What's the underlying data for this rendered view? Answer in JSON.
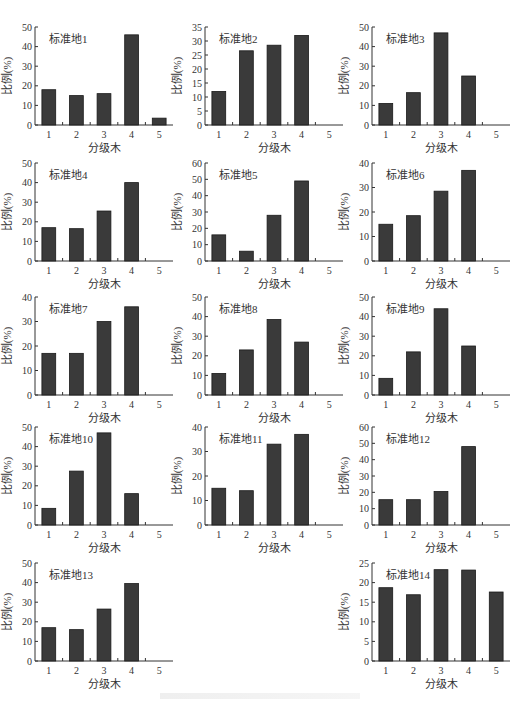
{
  "chart_data": [
    {
      "type": "bar",
      "title": "标准地1",
      "categories": [
        "1",
        "2",
        "3",
        "4",
        "5"
      ],
      "values": [
        18,
        15,
        16,
        46,
        3.5
      ],
      "xlabel": "分级木",
      "ylabel": "比例(%)",
      "ylim": [
        0,
        50
      ],
      "yticks": [
        0,
        10,
        20,
        30,
        40,
        50
      ],
      "grid": false,
      "legend": null
    },
    {
      "type": "bar",
      "title": "标准地2",
      "categories": [
        "1",
        "2",
        "3",
        "4",
        "5"
      ],
      "values": [
        12,
        26.5,
        28.5,
        32,
        0
      ],
      "xlabel": "分级木",
      "ylabel": "比例(%)",
      "ylim": [
        0,
        35
      ],
      "yticks": [
        0,
        5,
        10,
        15,
        20,
        25,
        30,
        35
      ],
      "grid": false,
      "legend": null
    },
    {
      "type": "bar",
      "title": "标准地3",
      "categories": [
        "1",
        "2",
        "3",
        "4",
        "5"
      ],
      "values": [
        11,
        16.5,
        47,
        25,
        0
      ],
      "xlabel": "分级木",
      "ylabel": "比例(%)",
      "ylim": [
        0,
        50
      ],
      "yticks": [
        0,
        10,
        20,
        30,
        40,
        50
      ],
      "grid": false,
      "legend": null
    },
    {
      "type": "bar",
      "title": "标准地4",
      "categories": [
        "1",
        "2",
        "3",
        "4",
        "5"
      ],
      "values": [
        17,
        16.5,
        25.5,
        40,
        0
      ],
      "xlabel": "分级木",
      "ylabel": "比例(%)",
      "ylim": [
        0,
        50
      ],
      "yticks": [
        0,
        10,
        20,
        30,
        40,
        50
      ],
      "grid": false,
      "legend": null
    },
    {
      "type": "bar",
      "title": "标准地5",
      "categories": [
        "1",
        "2",
        "3",
        "4",
        "5"
      ],
      "values": [
        16,
        6,
        28,
        49,
        0
      ],
      "xlabel": "分级木",
      "ylabel": "比例(%)",
      "ylim": [
        0,
        60
      ],
      "yticks": [
        0,
        10,
        20,
        30,
        40,
        50,
        60
      ],
      "grid": false,
      "legend": null
    },
    {
      "type": "bar",
      "title": "标准地6",
      "categories": [
        "1",
        "2",
        "3",
        "4",
        "5"
      ],
      "values": [
        15,
        18.5,
        28.5,
        37,
        0
      ],
      "xlabel": "分级木",
      "ylabel": "比例(%)",
      "ylim": [
        0,
        40
      ],
      "yticks": [
        0,
        10,
        20,
        30,
        40
      ],
      "grid": false,
      "legend": null
    },
    {
      "type": "bar",
      "title": "标准地7",
      "categories": [
        "1",
        "2",
        "3",
        "4",
        "5"
      ],
      "values": [
        17,
        17,
        30,
        36,
        0
      ],
      "xlabel": "分级木",
      "ylabel": "比例(%)",
      "ylim": [
        0,
        40
      ],
      "yticks": [
        0,
        10,
        20,
        30,
        40
      ],
      "grid": false,
      "legend": null
    },
    {
      "type": "bar",
      "title": "标准地8",
      "categories": [
        "1",
        "2",
        "3",
        "4",
        "5"
      ],
      "values": [
        11,
        23,
        38.5,
        27,
        0
      ],
      "xlabel": "分级木",
      "ylabel": "比例(%)",
      "ylim": [
        0,
        50
      ],
      "yticks": [
        0,
        10,
        20,
        30,
        40,
        50
      ],
      "grid": false,
      "legend": null
    },
    {
      "type": "bar",
      "title": "标准地9",
      "categories": [
        "1",
        "2",
        "3",
        "4",
        "5"
      ],
      "values": [
        8.5,
        22,
        44,
        25,
        0
      ],
      "xlabel": "分级木",
      "ylabel": "比例(%)",
      "ylim": [
        0,
        50
      ],
      "yticks": [
        0,
        10,
        20,
        30,
        40,
        50
      ],
      "grid": false,
      "legend": null
    },
    {
      "type": "bar",
      "title": "标准地10",
      "categories": [
        "1",
        "2",
        "3",
        "4",
        "5"
      ],
      "values": [
        8.5,
        27.5,
        47,
        16,
        0
      ],
      "xlabel": "分级木",
      "ylabel": "比例(%)",
      "ylim": [
        0,
        50
      ],
      "yticks": [
        0,
        10,
        20,
        30,
        40,
        50
      ],
      "grid": false,
      "legend": null
    },
    {
      "type": "bar",
      "title": "标准地11",
      "categories": [
        "1",
        "2",
        "3",
        "4",
        "5"
      ],
      "values": [
        15,
        14,
        33,
        37,
        0
      ],
      "xlabel": "分级木",
      "ylabel": "比例(%)",
      "ylim": [
        0,
        40
      ],
      "yticks": [
        0,
        10,
        20,
        30,
        40
      ],
      "grid": false,
      "legend": null
    },
    {
      "type": "bar",
      "title": "标准地12",
      "categories": [
        "1",
        "2",
        "3",
        "4",
        "5"
      ],
      "values": [
        15.5,
        15.5,
        20.5,
        48,
        0
      ],
      "xlabel": "分级木",
      "ylabel": "比例(%)",
      "ylim": [
        0,
        60
      ],
      "yticks": [
        0,
        10,
        20,
        30,
        40,
        50,
        60
      ],
      "grid": false,
      "legend": null
    },
    {
      "type": "bar",
      "title": "标准地13",
      "categories": [
        "1",
        "2",
        "3",
        "4",
        "5"
      ],
      "values": [
        17,
        16,
        26.5,
        39.5,
        0
      ],
      "xlabel": "分级木",
      "ylabel": "比例(%)",
      "ylim": [
        0,
        50
      ],
      "yticks": [
        0,
        10,
        20,
        30,
        40,
        50
      ],
      "grid": false,
      "legend": null
    },
    {
      "type": "bar",
      "title": "标准地14",
      "categories": [
        "1",
        "2",
        "3",
        "4",
        "5"
      ],
      "values": [
        18.7,
        16.9,
        23.3,
        23.2,
        17.6
      ],
      "xlabel": "分级木",
      "ylabel": "比例(%)",
      "ylim": [
        0,
        25
      ],
      "yticks": [
        0,
        5,
        10,
        15,
        20,
        25
      ],
      "grid": false,
      "legend": null
    }
  ],
  "layout": {
    "panels": [
      {
        "x": 35,
        "y": 27,
        "w": 138,
        "h": 98
      },
      {
        "x": 205,
        "y": 27,
        "w": 138,
        "h": 98
      },
      {
        "x": 372,
        "y": 27,
        "w": 138,
        "h": 98
      },
      {
        "x": 35,
        "y": 163,
        "w": 138,
        "h": 98
      },
      {
        "x": 205,
        "y": 163,
        "w": 138,
        "h": 98
      },
      {
        "x": 372,
        "y": 163,
        "w": 138,
        "h": 98
      },
      {
        "x": 35,
        "y": 297,
        "w": 138,
        "h": 98
      },
      {
        "x": 205,
        "y": 297,
        "w": 138,
        "h": 98
      },
      {
        "x": 372,
        "y": 297,
        "w": 138,
        "h": 98
      },
      {
        "x": 35,
        "y": 427,
        "w": 138,
        "h": 98
      },
      {
        "x": 205,
        "y": 427,
        "w": 138,
        "h": 98
      },
      {
        "x": 372,
        "y": 427,
        "w": 138,
        "h": 98
      },
      {
        "x": 35,
        "y": 563,
        "w": 138,
        "h": 98
      },
      {
        "x": 372,
        "y": 563,
        "w": 138,
        "h": 98
      }
    ]
  },
  "colors": {
    "bar_fill": "#3a3a3a",
    "bar_stroke": "#1a1a1a",
    "axis": "#333333",
    "text": "#333333"
  }
}
